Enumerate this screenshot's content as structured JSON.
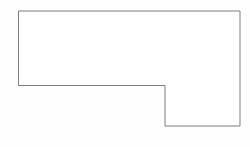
{
  "canvas": {
    "width": 250,
    "height": 147,
    "background_color": "#fefefe",
    "title": "L-shaped polygon outline"
  },
  "drawing": {
    "name": "l-shaped-outline",
    "description": "Single closed line drawing of an L-shaped (six-sided) figure, a rectangle with a notch removed from the lower-left portion",
    "shape_type": "polygon",
    "vertex_count": 6,
    "stroke_color": "#7d7d7d",
    "stroke_width": 1,
    "fill_color": "#ffffff",
    "points": "19,11 240,11 240,126 165,126 165,85.5 19,85.5",
    "vertices": [
      {
        "label": "top-left",
        "x": 19,
        "y": 11
      },
      {
        "label": "top-right",
        "x": 240,
        "y": 11
      },
      {
        "label": "bottom-right",
        "x": 240,
        "y": 126
      },
      {
        "label": "notch-bottom-left",
        "x": 165,
        "y": 126
      },
      {
        "label": "notch-inner-corner",
        "x": 165,
        "y": 85.5
      },
      {
        "label": "left-step-end",
        "x": 19,
        "y": 85.5
      }
    ],
    "edges": [
      {
        "name": "top-edge",
        "from": "top-left",
        "to": "top-right",
        "orientation": "horizontal",
        "length": 221
      },
      {
        "name": "right-edge",
        "from": "top-right",
        "to": "bottom-right",
        "orientation": "vertical",
        "length": 115
      },
      {
        "name": "bottom-edge",
        "from": "bottom-right",
        "to": "notch-bottom-left",
        "orientation": "horizontal",
        "length": 75
      },
      {
        "name": "notch-vertical-edge",
        "from": "notch-bottom-left",
        "to": "notch-inner-corner",
        "orientation": "vertical",
        "length": 40.5
      },
      {
        "name": "notch-horizontal-edge",
        "from": "notch-inner-corner",
        "to": "left-step-end",
        "orientation": "horizontal",
        "length": 146
      },
      {
        "name": "left-edge",
        "from": "left-step-end",
        "to": "top-left",
        "orientation": "vertical",
        "length": 74.5
      }
    ]
  }
}
